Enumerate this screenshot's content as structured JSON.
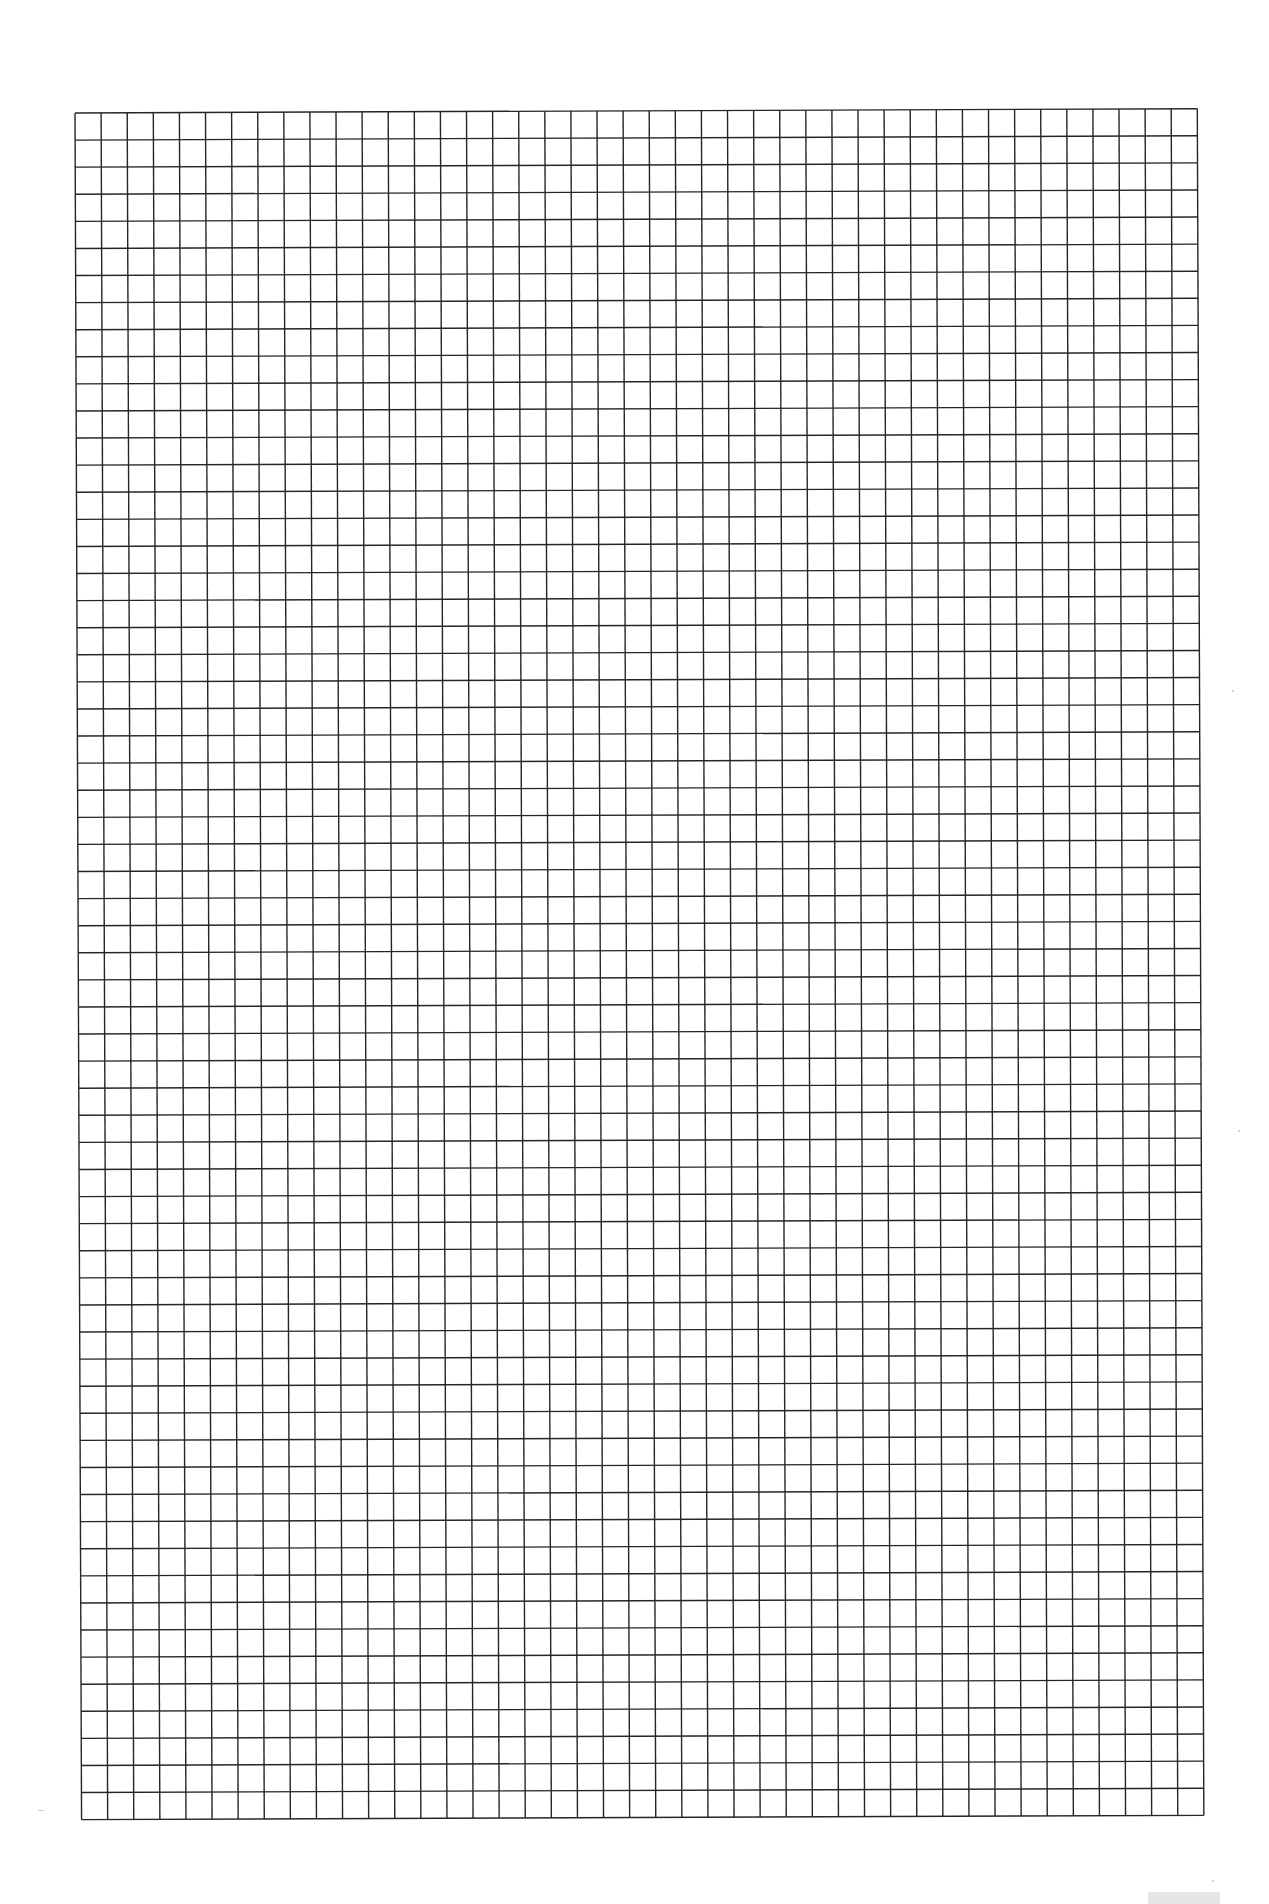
{
  "page": {
    "type": "graph-paper-sheet",
    "background_color": "#ffffff"
  },
  "grid": {
    "left": 75,
    "top": 113,
    "columns": 43,
    "rows": 63,
    "cell_width": 26.1,
    "cell_height": 27.09,
    "line_color": "#262626",
    "line_width": 1.4,
    "rotation_deg": -0.22
  },
  "footer": {
    "page_number_box_color": "#e6e6e6"
  }
}
